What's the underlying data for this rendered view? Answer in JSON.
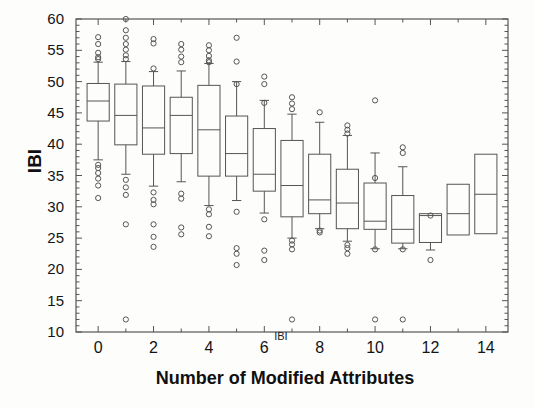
{
  "chart": {
    "title": "",
    "xlabel": "Number of Modified Attributes",
    "ylabel": "IBI",
    "inner_label": "IBI"
  },
  "axes": {
    "y_ticks": [
      "60",
      "55",
      "50",
      "45",
      "40",
      "35",
      "30",
      "25",
      "20",
      "15",
      "10"
    ],
    "x_ticks": [
      "0",
      "2",
      "4",
      "6",
      "8",
      "10",
      "12",
      "14"
    ]
  },
  "chart_data": {
    "type": "box",
    "title": "",
    "xlabel": "Number of Modified Attributes",
    "ylabel": "IBI",
    "annotations": [
      {
        "text": "IBI",
        "x": 6.6,
        "y": 11.0
      }
    ],
    "xlim": [
      -0.8,
      14.8
    ],
    "ylim": [
      10,
      60
    ],
    "ytick_values": [
      60,
      55,
      50,
      45,
      40,
      35,
      30,
      25,
      20,
      15,
      10
    ],
    "xtick_values": [
      0,
      2,
      4,
      6,
      8,
      10,
      12,
      14
    ],
    "minor_ticks": true,
    "grid": false,
    "legend": null,
    "categories": [
      0,
      1,
      2,
      3,
      4,
      5,
      6,
      7,
      8,
      9,
      10,
      11,
      12,
      13,
      14
    ],
    "boxes": [
      {
        "category": 0,
        "whisker_low": 37.5,
        "q1": 43.7,
        "median": 46.9,
        "q3": 49.7,
        "whisker_high": 53.1,
        "outliers": [
          57.1,
          56.0,
          54.6,
          53.9,
          53.6,
          36.7,
          36.2,
          35.4,
          34.5,
          33.4,
          31.4
        ]
      },
      {
        "category": 1,
        "whisker_low": 35.2,
        "q1": 39.9,
        "median": 44.6,
        "q3": 49.6,
        "whisker_high": 53.2,
        "outliers": [
          60.0,
          58.2,
          57.0,
          56.0,
          55.1,
          54.2,
          53.6,
          34.3,
          33.1,
          31.9,
          27.2,
          12.0
        ]
      },
      {
        "category": 2,
        "whisker_low": 33.3,
        "q1": 38.4,
        "median": 42.6,
        "q3": 49.3,
        "whisker_high": 51.6,
        "outliers": [
          56.8,
          56.1,
          52.1,
          32.3,
          31.1,
          30.4,
          27.2,
          25.2,
          23.6
        ]
      },
      {
        "category": 3,
        "whisker_low": 34.0,
        "q1": 38.5,
        "median": 44.6,
        "q3": 47.5,
        "whisker_high": 51.7,
        "outliers": [
          56.0,
          55.1,
          54.0,
          53.1,
          32.1,
          31.3,
          26.7,
          25.6
        ]
      },
      {
        "category": 4,
        "whisker_low": 30.2,
        "q1": 34.9,
        "median": 42.3,
        "q3": 49.4,
        "whisker_high": 52.9,
        "outliers": [
          55.8,
          55.0,
          54.1,
          53.4,
          53.1,
          29.6,
          28.8,
          26.8,
          25.3
        ]
      },
      {
        "category": 5,
        "whisker_low": 31.0,
        "q1": 34.9,
        "median": 38.5,
        "q3": 44.5,
        "whisker_high": 50.0,
        "outliers": [
          57.0,
          53.2,
          49.6,
          29.2,
          23.4,
          22.5,
          20.7
        ]
      },
      {
        "category": 6,
        "whisker_low": 29.0,
        "q1": 32.5,
        "median": 35.2,
        "q3": 42.5,
        "whisker_high": 47.0,
        "outliers": [
          50.8,
          49.6,
          46.6,
          28.0,
          23.0,
          21.5
        ]
      },
      {
        "category": 7,
        "whisker_low": 25.0,
        "q1": 28.4,
        "median": 33.4,
        "q3": 40.6,
        "whisker_high": 44.8,
        "outliers": [
          47.5,
          46.5,
          45.6,
          24.6,
          24.0,
          23.2,
          12.0
        ]
      },
      {
        "category": 8,
        "whisker_low": 26.5,
        "q1": 28.9,
        "median": 31.1,
        "q3": 38.4,
        "whisker_high": 43.5,
        "outliers": [
          45.1,
          26.2,
          25.9
        ]
      },
      {
        "category": 9,
        "whisker_low": 24.5,
        "q1": 26.5,
        "median": 30.6,
        "q3": 36.0,
        "whisker_high": 41.4,
        "outliers": [
          43.0,
          42.3,
          41.7,
          23.9,
          23.4,
          22.5
        ]
      },
      {
        "category": 10,
        "whisker_low": 23.3,
        "q1": 26.4,
        "median": 27.7,
        "q3": 33.8,
        "whisker_high": 38.6,
        "outliers": [
          47.0,
          34.6,
          23.2,
          12.0
        ]
      },
      {
        "category": 11,
        "whisker_low": 23.3,
        "q1": 24.2,
        "median": 26.4,
        "q3": 31.8,
        "whisker_high": 36.4,
        "outliers": [
          39.5,
          38.6,
          23.2,
          12.0
        ]
      },
      {
        "category": 12,
        "whisker_low": 23.1,
        "q1": 24.3,
        "median": 28.6,
        "q3": 28.9,
        "whisker_high": 28.9,
        "outliers": [
          28.6,
          21.5
        ]
      },
      {
        "category": 13,
        "whisker_low": 25.5,
        "q1": 25.5,
        "median": 28.9,
        "q3": 33.6,
        "whisker_high": 33.6,
        "outliers": []
      },
      {
        "category": 14,
        "whisker_low": 25.7,
        "q1": 25.7,
        "median": 32.0,
        "q3": 38.4,
        "whisker_high": 38.4,
        "outliers": []
      }
    ]
  },
  "style": {
    "line_color": "#555555",
    "text_color": "#141414",
    "background": "#fdfdfc"
  }
}
